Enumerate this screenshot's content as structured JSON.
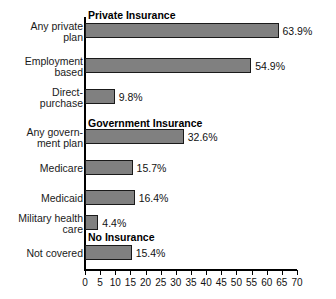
{
  "chart_data": {
    "type": "bar",
    "orientation": "horizontal",
    "title": "",
    "xlabel": "",
    "ylabel": "",
    "xlim": [
      0,
      70
    ],
    "xticks": [
      0,
      5,
      10,
      15,
      20,
      25,
      30,
      35,
      40,
      45,
      50,
      55,
      60,
      65,
      70
    ],
    "xtick_labels": [
      "0",
      "5",
      "10",
      "15",
      "20",
      "25",
      "30",
      "35",
      "40",
      "45",
      "50",
      "55",
      "60",
      "65",
      "70"
    ],
    "grid": false,
    "legend": null,
    "value_suffix": "%",
    "bar_color": "#808080",
    "bar_edge_color": "#1a1a1a",
    "categories": [
      "Any private\nplan",
      "Employment\nbased",
      "Direct-\npurchase",
      "Any govern-\nment plan",
      "Medicare",
      "Medicaid",
      "Military health\ncare",
      "Not covered"
    ],
    "values": [
      63.9,
      54.9,
      9.8,
      32.6,
      15.7,
      16.4,
      4.4,
      15.4
    ],
    "value_labels": [
      "63.9%",
      "54.9%",
      "9.8%",
      "32.6%",
      "15.7%",
      "16.4%",
      "4.4%",
      "15.4%"
    ],
    "section_headers": [
      {
        "label": "Private Insurance",
        "before_category_index": 0
      },
      {
        "label": "Government Insurance",
        "before_category_index": 3
      },
      {
        "label": "No Insurance",
        "before_category_index": 7
      }
    ]
  }
}
